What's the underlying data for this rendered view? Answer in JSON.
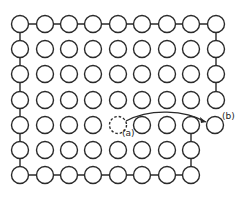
{
  "diagram": {
    "grid": {
      "columns_x": [
        20,
        45,
        69,
        93,
        118,
        142,
        167,
        191,
        216
      ],
      "rows_y": [
        24,
        49,
        74,
        100,
        125,
        150,
        175
      ],
      "radius": 8.5
    },
    "labels": {
      "vacancy": "(a)",
      "displaced_atom": "(b)"
    },
    "colors": {
      "stroke": "#2a2a2a",
      "fill": "#ffffff"
    }
  }
}
